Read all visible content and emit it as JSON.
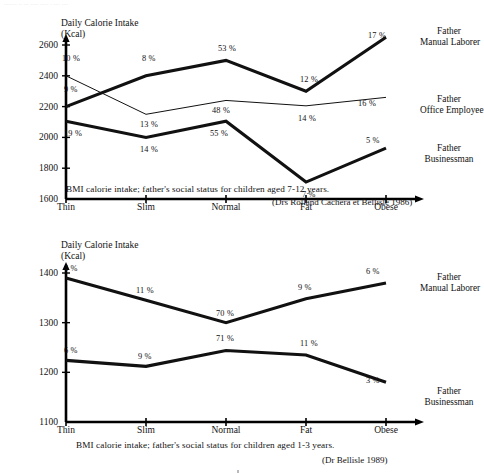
{
  "artifact_text": "........ .. ... ..... .....   .   .... ....",
  "chart_data": [
    {
      "id": "top",
      "type": "line",
      "title": "",
      "ylabel_line1": "Daily Calorie Intake",
      "ylabel_line2": "(Kcal)",
      "xlabel": "",
      "categories": [
        "Thin",
        "Slim",
        "Normal",
        "Fat",
        "Obese"
      ],
      "ylim": [
        1600,
        2600
      ],
      "yticks": [
        1600,
        1800,
        2000,
        2200,
        2400,
        2600
      ],
      "grid": false,
      "legend_position": "right",
      "caption": "BMI calorie intake; father's social status for children aged 7-12 years.",
      "source": "(Drs Rolland Cachera et Bellisle 1986)",
      "series": [
        {
          "name": "Father Manual Laborer",
          "label_line1": "Father",
          "label_line2": "Manual Laborer",
          "style": "thick",
          "values": [
            2200,
            2400,
            2500,
            2300,
            2650
          ],
          "point_labels": [
            "9 %",
            "8 %",
            "53 %",
            "12 %",
            "17 %"
          ]
        },
        {
          "name": "Father Office Employee",
          "label_line1": "Father",
          "label_line2": "Office Employee",
          "style": "thin",
          "values": [
            2400,
            2150,
            2240,
            2205,
            2260
          ],
          "point_labels": [
            "10 %",
            "13 %",
            "48 %",
            "14 %",
            "16 %"
          ]
        },
        {
          "name": "Father Businessman",
          "label_line1": "Father",
          "label_line2": "Businessman",
          "style": "thick",
          "values": [
            2105,
            2000,
            2105,
            1710,
            1930
          ],
          "point_labels": [
            "19 %",
            "14 %",
            "55 %",
            "7 %",
            "5 %"
          ]
        }
      ]
    },
    {
      "id": "bottom",
      "type": "line",
      "title": "",
      "ylabel_line1": "Daily Calorie Intake",
      "ylabel_line2": "(Kcal)",
      "xlabel": "",
      "categories": [
        "Thin",
        "Slim",
        "Normal",
        "Fat",
        "Obese"
      ],
      "ylim": [
        1100,
        1400
      ],
      "yticks": [
        1100,
        1200,
        1300,
        1400
      ],
      "grid": false,
      "legend_position": "right",
      "caption": "BMI calorie intake; father's social status for children aged 1-3 years.",
      "source": "(Dr Bellisle 1989)",
      "series": [
        {
          "name": "Father Manual Laborer",
          "label_line1": "Father",
          "label_line2": "Manual Laborer",
          "style": "thick",
          "values": [
            1390,
            1345,
            1300,
            1348,
            1380
          ],
          "point_labels": [
            "4 %",
            "11 %",
            "70 %",
            "9 %",
            "6 %"
          ]
        },
        {
          "name": "Father Businessman",
          "label_line1": "Father",
          "label_line2": "Businessman",
          "style": "thick",
          "values": [
            1224,
            1212,
            1244,
            1235,
            1180
          ],
          "point_labels": [
            "6 %",
            "9 %",
            "71 %",
            "11 %",
            "3 %"
          ]
        }
      ]
    }
  ],
  "colors": {
    "ink": "#111111",
    "axis": "#000000",
    "faint": "#cfcfd6"
  }
}
